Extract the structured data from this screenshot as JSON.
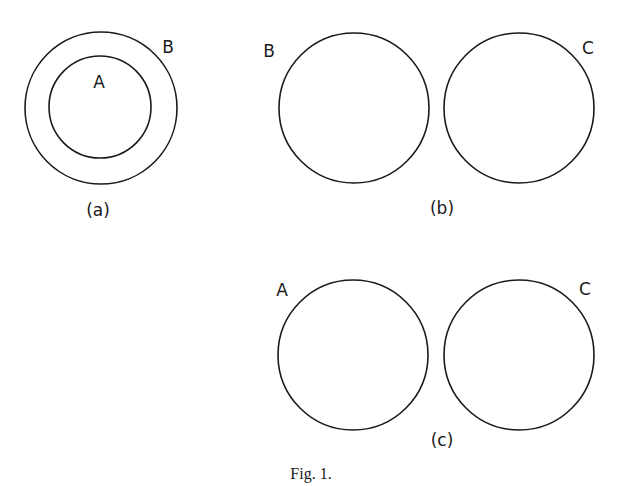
{
  "figure": {
    "caption": "Fig. 1.",
    "panels": [
      {
        "id": "a",
        "label": "(a)",
        "relation": "A contained in B",
        "sets": [
          {
            "name": "B",
            "cx": 101,
            "cy": 108,
            "r": 76,
            "label_x": 168,
            "label_y": 53
          },
          {
            "name": "A",
            "cx": 100,
            "cy": 107,
            "r": 51,
            "label_x": 99,
            "label_y": 88
          }
        ],
        "label_x": 98,
        "label_y": 216
      },
      {
        "id": "b",
        "label": "(b)",
        "relation": "B and C disjoint",
        "sets": [
          {
            "name": "B",
            "cx": 354,
            "cy": 108,
            "r": 75,
            "label_x": 269,
            "label_y": 57
          },
          {
            "name": "C",
            "cx": 519,
            "cy": 108,
            "r": 75,
            "label_x": 588,
            "label_y": 54
          }
        ],
        "label_x": 442,
        "label_y": 214
      },
      {
        "id": "c",
        "label": "(c)",
        "relation": "A and C disjoint",
        "sets": [
          {
            "name": "A",
            "cx": 353,
            "cy": 355,
            "r": 75,
            "label_x": 282,
            "label_y": 296
          },
          {
            "name": "C",
            "cx": 519,
            "cy": 355,
            "r": 75,
            "label_x": 585,
            "label_y": 295
          }
        ],
        "label_x": 442,
        "label_y": 446
      }
    ]
  }
}
